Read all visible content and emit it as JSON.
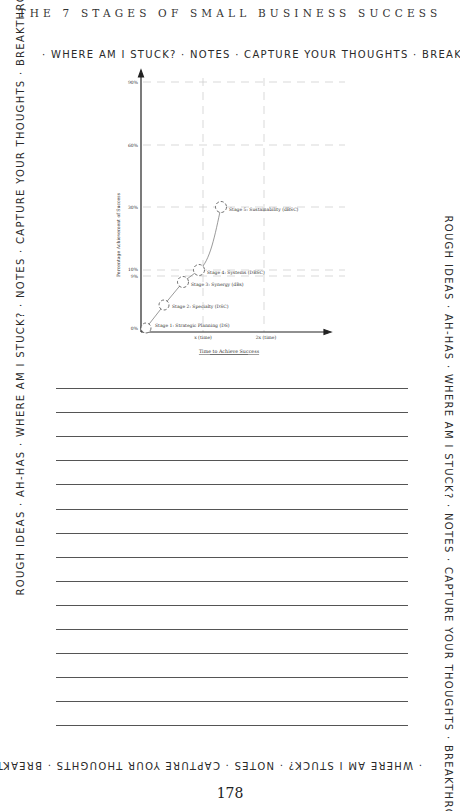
{
  "header": {
    "title": "THE 7 STAGES OF SMALL BUSINESS SUCCESS"
  },
  "border": {
    "top": "· WHERE AM I STUCK? · NOTES · CAPTURE YOUR THOUGHTS · BREAKTH",
    "right": "ROUGH IDEAS · AH-HAS · WHERE AM I STUCK? · NOTES · CAPTURE YOUR THOUGHTS · BREAKTHROUGH IDEAS · AH-HAS ·",
    "bottom": "· WHERE AM I STUCK? · NOTES · CAPTURE YOUR THOUGHTS · BREAKTH",
    "left": "ROUGH IDEAS · AH-HAS · WHERE AM I STUCK? · NOTES · CAPTURE YOUR THOUGHTS · BREAKTHROUGH IDEAS · AH-HAS ·"
  },
  "chart_data": {
    "type": "line",
    "title": "",
    "xlabel": "Time to Achieve Success",
    "ylabel": "Percentage Achievement of Success",
    "x_ticks": [
      "x (time)",
      "2x (time)"
    ],
    "y_ticks": [
      "0%",
      "9%",
      "10%",
      "30%",
      "60%",
      "90%"
    ],
    "ylim": [
      0,
      90
    ],
    "grid": true,
    "points": [
      {
        "label": "Stage 1: Strategic Planning (DS)",
        "x": 0.05,
        "y": 0
      },
      {
        "label": "Stage 2: Specialty (DSC)",
        "x": 0.38,
        "y": 4
      },
      {
        "label": "Stage 3: Synergy (dBs)",
        "x": 0.7,
        "y": 9
      },
      {
        "label": "Stage 4: Systems (DBSC)",
        "x": 0.95,
        "y": 10
      },
      {
        "label": "Stage 5: Sustainability (dBSC)",
        "x": 1.3,
        "y": 30
      }
    ]
  },
  "notes": {
    "line_count": 15
  },
  "footer": {
    "page_number": "178"
  }
}
